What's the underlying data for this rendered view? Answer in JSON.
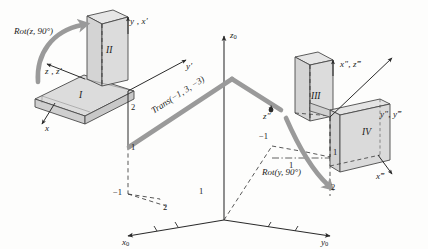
{
  "figure": {
    "type": "kinematics-transformation-diagram",
    "colors": {
      "line": "#2b2b2b",
      "arrow_fill": "#9a9a9a",
      "block_face": "#d9d9d9",
      "block_top": "#e8e8e8",
      "block_edge": "#4a4a4a",
      "dashed": "#3a3a3a",
      "background": "#fdfdfc"
    }
  },
  "world_axes": [
    {
      "name": "z0",
      "base": "z",
      "sub": "0"
    },
    {
      "name": "x0",
      "base": "x",
      "sub": "0"
    },
    {
      "name": "y0",
      "base": "y",
      "sub": "0"
    }
  ],
  "blocks": [
    {
      "id": "I",
      "label": "I"
    },
    {
      "id": "II",
      "label": "II"
    },
    {
      "id": "III",
      "label": "III"
    },
    {
      "id": "IV",
      "label": "IV"
    }
  ],
  "operations": [
    {
      "id": "rot-z",
      "label": "Rot(z, 90°)"
    },
    {
      "id": "trans",
      "label": "Trans(−1, 3, −3)"
    },
    {
      "id": "rot-y",
      "label": "Rot(y, 90°)"
    }
  ],
  "frame_labels": [
    {
      "id": "x",
      "text": "x"
    },
    {
      "id": "z-zp",
      "text": "z , z′"
    },
    {
      "id": "y-xp",
      "text": "y , x′"
    },
    {
      "id": "yp",
      "text": "y′"
    },
    {
      "id": "zpp",
      "text": "z″"
    },
    {
      "id": "xpp-zppp",
      "text": "x″, z‴"
    },
    {
      "id": "ypp-yppp",
      "text": "y″, y‴"
    },
    {
      "id": "xppp",
      "text": "x‴"
    }
  ],
  "tick_labels": [
    {
      "id": "tick-left-2",
      "text": "2"
    },
    {
      "id": "tick-left-1",
      "text": "1"
    },
    {
      "id": "tick-x0-neg1",
      "text": "−1"
    },
    {
      "id": "tick-x0-2",
      "text": "2"
    },
    {
      "id": "tick-axis-1",
      "text": "1"
    },
    {
      "id": "tick-y0-neg1",
      "text": "−1"
    },
    {
      "id": "tick-y0-1",
      "text": "1"
    },
    {
      "id": "tick-right-1",
      "text": "1"
    },
    {
      "id": "tick-right-2",
      "text": "2"
    }
  ]
}
